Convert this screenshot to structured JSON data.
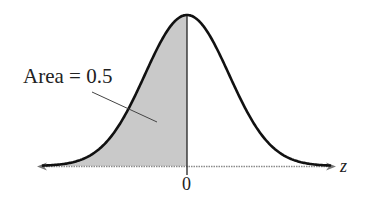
{
  "chart_data": {
    "type": "area",
    "title": "",
    "xlabel": "z",
    "ylabel": "",
    "x_ticks": [
      "0"
    ],
    "distribution": {
      "name": "standard normal",
      "mean": 0,
      "sd": 1
    },
    "shaded_region": {
      "from": "-inf",
      "to": 0,
      "area": 0.5
    },
    "annotations": [
      {
        "text": "Area = 0.5",
        "points_to": "shaded region left of 0"
      }
    ],
    "grid": false,
    "legend": null
  },
  "labels": {
    "area": "Area = 0.5",
    "axis_var": "z",
    "zero_tick": "0"
  },
  "colors": {
    "curve": "#111111",
    "fill": "#c9c9c9",
    "axis": "#8a8a8a",
    "leader": "#444444"
  },
  "geometry": {
    "x_left": 37,
    "x_right": 336,
    "center_x": 187,
    "baseline_y": 166,
    "peak_y": 15,
    "sigma_px": 42
  }
}
